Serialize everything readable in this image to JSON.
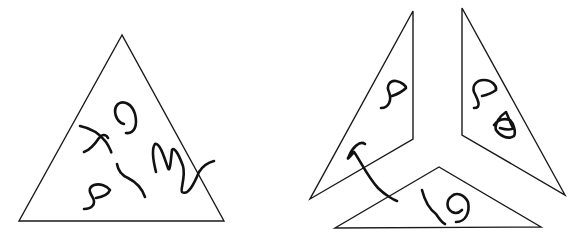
{
  "figure": {
    "description": "Triangle containing hand-drawn squiggles, shown whole (left) and dissected into three pieces (right)",
    "stroke_color": "#1a1a1a",
    "background": "#ffffff"
  },
  "panels": [
    {
      "id": "whole",
      "shape": "triangle",
      "vertices": [
        [
          122,
          35
        ],
        [
          19,
          221
        ],
        [
          224,
          221
        ]
      ],
      "scribbles": [
        "x-mark",
        "loop-9",
        "m-squiggle",
        "s-curve",
        "short-arc"
      ]
    },
    {
      "id": "dissected",
      "pieces": [
        {
          "id": "left-piece",
          "vertices": [
            [
              413,
              11
            ],
            [
              310,
              199
            ],
            [
              413,
              139
            ]
          ],
          "scribbles": [
            "s-curve",
            "hook"
          ]
        },
        {
          "id": "right-piece",
          "vertices": [
            [
              462,
              8
            ],
            [
              462,
              135
            ],
            [
              565,
              195
            ]
          ],
          "scribbles": [
            "s-curve",
            "loop-knot"
          ]
        },
        {
          "id": "bottom-piece",
          "vertices": [
            [
              439,
              167
            ],
            [
              335,
              228
            ],
            [
              541,
              227
            ]
          ],
          "scribbles": [
            "loop-9",
            "arc-tail"
          ]
        }
      ]
    }
  ]
}
